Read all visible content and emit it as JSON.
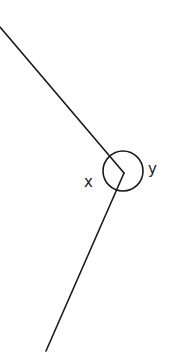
{
  "diagram": {
    "type": "angle-at-point",
    "stroke_color": "#1a1a1a",
    "background": "#ffffff",
    "vertex": {
      "x": 124,
      "y": 173
    },
    "rays": [
      {
        "name": "upper-ray",
        "from": {
          "x": 124,
          "y": 173
        },
        "to": {
          "x": 0,
          "y": 27
        }
      },
      {
        "name": "lower-ray",
        "from": {
          "x": 124,
          "y": 173
        },
        "to": {
          "x": 46,
          "y": 351
        }
      }
    ],
    "arc": {
      "cx": 123,
      "cy": 171,
      "r": 20
    },
    "labels": {
      "x": {
        "text": "x",
        "x": 84,
        "y": 187
      },
      "y": {
        "text": "y",
        "x": 148,
        "y": 174
      }
    }
  }
}
